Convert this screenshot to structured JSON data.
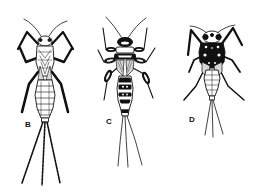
{
  "figure": {
    "background": "#ffffff",
    "ink_color": "#111111",
    "specimens": [
      {
        "id": "B",
        "label": "B",
        "description": "mayfly nymph with long legs, slender segmented abdomen and three long banded tails"
      },
      {
        "id": "C",
        "label": "C",
        "description": "mayfly nymph with dark banded head and thorax, dark-marked legs and three long thin tails"
      },
      {
        "id": "D",
        "label": "D",
        "description": "mayfly nymph with heavily dark-mottled head and thorax, splayed legs and three shorter tails"
      }
    ]
  }
}
